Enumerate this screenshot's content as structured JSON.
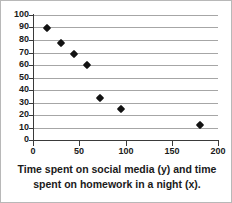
{
  "chart_data": {
    "type": "scatter",
    "title": "",
    "caption": "Time spent on social media (y) and time spent on homework in a night (x).",
    "xlabel": "Time spent on homework in a night (x)",
    "ylabel": "Time spent on social media (y)",
    "xlim": [
      0,
      200
    ],
    "ylim": [
      0,
      100
    ],
    "xticks": [
      0,
      50,
      100,
      150,
      200
    ],
    "yticks": [
      0,
      10,
      20,
      30,
      40,
      50,
      60,
      70,
      80,
      90,
      100
    ],
    "xtick_labels": [
      "0",
      "50",
      "100",
      "150",
      "200"
    ],
    "ytick_labels": [
      "0",
      "10",
      "20",
      "30",
      "40",
      "50",
      "60",
      "70",
      "80",
      "90",
      "100"
    ],
    "grid": "horizontal",
    "legend": "none",
    "marker": "diamond",
    "marker_color": "#121212",
    "gridline_color": "#a6a6a6",
    "axis_color": "#3a3a3a",
    "background": "#ffffff",
    "points": [
      {
        "x": 15,
        "y": 90
      },
      {
        "x": 30,
        "y": 78
      },
      {
        "x": 44,
        "y": 69
      },
      {
        "x": 58,
        "y": 60
      },
      {
        "x": 72,
        "y": 34
      },
      {
        "x": 95,
        "y": 25
      },
      {
        "x": 180,
        "y": 12
      }
    ]
  },
  "caption": {
    "line1": "Time spent on social media (y) and time",
    "line2": "spent on homework in a night (x)."
  }
}
